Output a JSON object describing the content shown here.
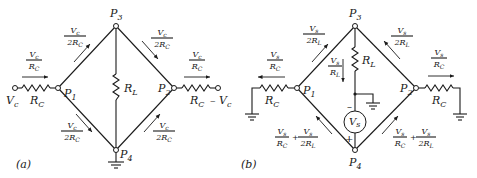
{
  "figure": {
    "panels": [
      {
        "id": "a",
        "label": "(a)",
        "nodes": {
          "p1": "P",
          "p1_sub": "1",
          "p2": "P",
          "p2_sub": "2",
          "p3": "P",
          "p3_sub": "3",
          "p4": "P",
          "p4_sub": "4"
        },
        "source_left": {
          "label": "V",
          "sub": "c"
        },
        "source_right": {
          "label": "– V",
          "sub": "c"
        },
        "resistors": {
          "left": {
            "label": "R",
            "sub": "C"
          },
          "right": {
            "label": "R",
            "sub": "C"
          },
          "load": {
            "label": "R",
            "sub": "L"
          }
        },
        "currents": {
          "left_in": {
            "num": "V",
            "num_sub": "c",
            "den": "R",
            "den_sub": "C"
          },
          "right_out": {
            "num": "V",
            "num_sub": "c",
            "den": "R",
            "den_sub": "C"
          },
          "p1_p3": {
            "num": "V",
            "num_sub": "c",
            "den": "2R",
            "den_sub": "C"
          },
          "p3_p2": {
            "num": "V",
            "num_sub": "c",
            "den": "2R",
            "den_sub": "C"
          },
          "p1_p4": {
            "num": "V",
            "num_sub": "c",
            "den": "2R",
            "den_sub": "C"
          },
          "p4_p2": {
            "num": "V",
            "num_sub": "c",
            "den": "2R",
            "den_sub": "C"
          }
        }
      },
      {
        "id": "b",
        "label": "(b)",
        "nodes": {
          "p1": "P",
          "p1_sub": "1",
          "p2": "P",
          "p2_sub": "2",
          "p3": "P",
          "p3_sub": "3",
          "p4": "P",
          "p4_sub": "4"
        },
        "source": {
          "label": "V",
          "sub": "s",
          "minus": "–",
          "plus": "+"
        },
        "resistors": {
          "left": {
            "label": "R",
            "sub": "C"
          },
          "right": {
            "label": "R",
            "sub": "C"
          },
          "load": {
            "label": "R",
            "sub": "L"
          }
        },
        "currents": {
          "left_out": {
            "num": "V",
            "num_sub": "s",
            "den": "R",
            "den_sub": "C"
          },
          "right_out": {
            "num": "V",
            "num_sub": "s",
            "den": "R",
            "den_sub": "C"
          },
          "p1_p3": {
            "num": "V",
            "num_sub": "s",
            "den": "2R",
            "den_sub": "L"
          },
          "p2_p3": {
            "num": "V",
            "num_sub": "s",
            "den": "2R",
            "den_sub": "L"
          },
          "load": {
            "num": "V",
            "num_sub": "s",
            "den": "R",
            "den_sub": "L"
          },
          "p4_p1": {
            "a_num": "V",
            "a_num_sub": "s",
            "a_den": "R",
            "a_den_sub": "C",
            "plus": "+",
            "b_num": "V",
            "b_num_sub": "s",
            "b_den": "2R",
            "b_den_sub": "L"
          },
          "p4_p2": {
            "a_num": "V",
            "a_num_sub": "s",
            "a_den": "R",
            "a_den_sub": "C",
            "plus": "+",
            "b_num": "V",
            "b_num_sub": "s",
            "b_den": "2R",
            "b_den_sub": "L"
          }
        }
      }
    ]
  }
}
